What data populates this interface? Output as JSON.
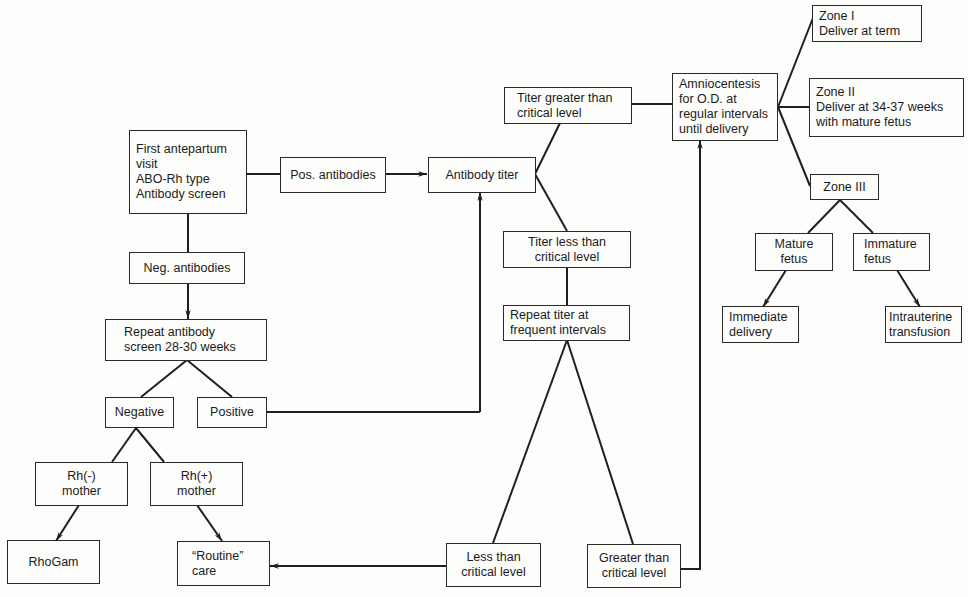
{
  "diagram": {
    "type": "flowchart",
    "nodes": {
      "first_visit": {
        "lines": [
          "First antepartum",
          "visit",
          "ABO-Rh type",
          "Antibody screen"
        ]
      },
      "pos_antibodies": {
        "lines": [
          "Pos. antibodies"
        ]
      },
      "antibody_titer": {
        "lines": [
          "Antibody titer"
        ]
      },
      "titer_greater": {
        "lines": [
          "Titer greater than",
          "critical level"
        ]
      },
      "amniocentesis": {
        "lines": [
          "Amniocentesis",
          "for O.D. at",
          "regular intervals",
          "until delivery"
        ]
      },
      "zone1": {
        "lines": [
          "Zone I",
          "Deliver at term"
        ]
      },
      "zone2": {
        "lines": [
          "Zone II",
          "Deliver at 34-37 weeks",
          "with mature fetus"
        ]
      },
      "zone3": {
        "lines": [
          "Zone III"
        ]
      },
      "mature_fetus": {
        "lines": [
          "Mature",
          "fetus"
        ]
      },
      "immature_fetus": {
        "lines": [
          "Immature",
          "fetus"
        ]
      },
      "immediate_delivery": {
        "lines": [
          "Immediate",
          "delivery"
        ]
      },
      "intrauterine_transfusion": {
        "lines": [
          "Intrauterine",
          "transfusion"
        ]
      },
      "titer_less": {
        "lines": [
          "Titer less than",
          "critical level"
        ]
      },
      "repeat_titer": {
        "lines": [
          "Repeat titer at",
          "frequent intervals"
        ]
      },
      "less_than": {
        "lines": [
          "Less than",
          "critical level"
        ]
      },
      "greater_than": {
        "lines": [
          "Greater than",
          "critical level"
        ]
      },
      "neg_antibodies": {
        "lines": [
          "Neg. antibodies"
        ]
      },
      "repeat_screen": {
        "lines": [
          "Repeat antibody",
          "screen 28-30 weeks"
        ]
      },
      "negative": {
        "lines": [
          "Negative"
        ]
      },
      "positive": {
        "lines": [
          "Positive"
        ]
      },
      "rh_neg_mother": {
        "lines": [
          "Rh(-)",
          "mother"
        ]
      },
      "rh_pos_mother": {
        "lines": [
          "Rh(+)",
          "mother"
        ]
      },
      "rhogam": {
        "lines": [
          "RhoGam"
        ]
      },
      "routine_care": {
        "lines": [
          "“Routine”",
          "care"
        ]
      }
    },
    "edges": [
      {
        "from": "first_visit",
        "to": "pos_antibodies",
        "arrow": false
      },
      {
        "from": "pos_antibodies",
        "to": "antibody_titer",
        "arrow": true
      },
      {
        "from": "antibody_titer",
        "to": "titer_greater",
        "arrow": false
      },
      {
        "from": "antibody_titer",
        "to": "titer_less",
        "arrow": false
      },
      {
        "from": "titer_greater",
        "to": "amniocentesis",
        "arrow": false
      },
      {
        "from": "amniocentesis",
        "to": "zone1",
        "arrow": false
      },
      {
        "from": "amniocentesis",
        "to": "zone2",
        "arrow": false
      },
      {
        "from": "amniocentesis",
        "to": "zone3",
        "arrow": false
      },
      {
        "from": "zone3",
        "to": "mature_fetus",
        "arrow": false
      },
      {
        "from": "zone3",
        "to": "immature_fetus",
        "arrow": false
      },
      {
        "from": "mature_fetus",
        "to": "immediate_delivery",
        "arrow": true
      },
      {
        "from": "immature_fetus",
        "to": "intrauterine_transfusion",
        "arrow": true
      },
      {
        "from": "titer_less",
        "to": "repeat_titer",
        "arrow": false
      },
      {
        "from": "repeat_titer",
        "to": "less_than",
        "arrow": false
      },
      {
        "from": "repeat_titer",
        "to": "greater_than",
        "arrow": false
      },
      {
        "from": "less_than",
        "to": "routine_care",
        "arrow": true
      },
      {
        "from": "greater_than",
        "to": "amniocentesis",
        "arrow": true
      },
      {
        "from": "first_visit",
        "to": "neg_antibodies",
        "arrow": false
      },
      {
        "from": "neg_antibodies",
        "to": "repeat_screen",
        "arrow": true
      },
      {
        "from": "repeat_screen",
        "to": "negative",
        "arrow": false
      },
      {
        "from": "repeat_screen",
        "to": "positive",
        "arrow": false
      },
      {
        "from": "positive",
        "to": "antibody_titer",
        "arrow": true
      },
      {
        "from": "negative",
        "to": "rh_neg_mother",
        "arrow": false
      },
      {
        "from": "negative",
        "to": "rh_pos_mother",
        "arrow": false
      },
      {
        "from": "rh_neg_mother",
        "to": "rhogam",
        "arrow": true
      },
      {
        "from": "rh_pos_mother",
        "to": "routine_care",
        "arrow": true
      }
    ]
  },
  "colors": {
    "line": "#1f1f1f",
    "background": "#fdfdfc"
  }
}
